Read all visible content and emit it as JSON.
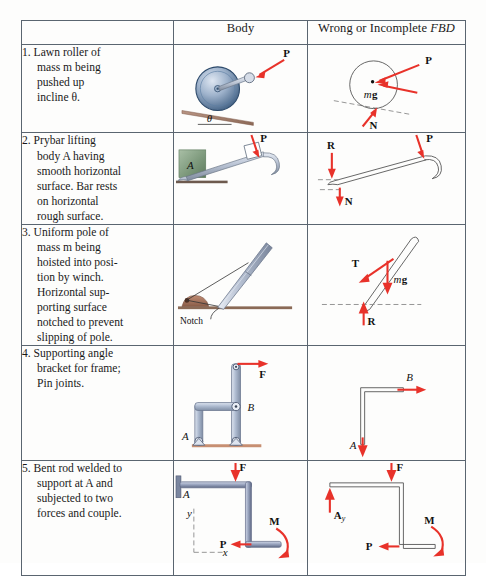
{
  "table": {
    "headers": {
      "description": "",
      "body": "Body",
      "fbd_prefix": "Wrong or Incomplete ",
      "fbd_italic": "FBD"
    },
    "rows": [
      {
        "number": "1.",
        "description": "1. Lawn roller of\nmass m being\npushed up\nincline θ.",
        "body_labels": [
          "P",
          "θ"
        ],
        "fbd_labels": [
          "P",
          "mg",
          "N"
        ]
      },
      {
        "number": "2.",
        "description": "2. Prybar lifting\nbody A having\nsmooth horizontal\nsurface.  Bar rests\non horizontal\nrough surface.",
        "body_labels": [
          "P",
          "A"
        ],
        "fbd_labels": [
          "R",
          "P",
          "N"
        ]
      },
      {
        "number": "3.",
        "description": "3. Uniform pole of\nmass m being\nhoisted into posi-\ntion by winch.\nHorizontal sup-\nporting surface\nnotched to prevent\nslipping of pole.",
        "body_labels": [
          "Notch"
        ],
        "fbd_labels": [
          "T",
          "mg",
          "R"
        ]
      },
      {
        "number": "4.",
        "description": "4. Supporting angle\nbracket for frame;\nPin joints.",
        "body_labels": [
          "F",
          "B",
          "A"
        ],
        "fbd_labels": [
          "B",
          "A"
        ]
      },
      {
        "number": "5.",
        "description": "5. Bent rod welded to\nsupport at A and\nsubjected to two\nforces and couple.",
        "body_labels": [
          "F",
          "A",
          "y",
          "x",
          "P",
          "M"
        ],
        "fbd_labels": [
          "F",
          "A_y",
          "P",
          "M"
        ]
      }
    ]
  },
  "symbols": {
    "force_P": "P",
    "force_N": "N",
    "force_R": "R",
    "force_T": "T",
    "force_F": "F",
    "moment_M": "M",
    "weight_mg_m": "m",
    "weight_mg_g": "g",
    "point_A": "A",
    "point_B": "B",
    "axis_x": "x",
    "axis_y": "y",
    "angle_theta": "θ",
    "notch_label": "Notch",
    "reaction_Ay_base": "A",
    "reaction_Ay_sub": "y"
  },
  "colors": {
    "force_red": "#e8322a",
    "rule_gray": "#5a6570",
    "rod_fill": "#c9d0e4",
    "rod_stroke": "#6b7390",
    "incline_brown": "#9a7866",
    "block_green": "#7f9a7f",
    "roller_blue": "#4a6c93"
  }
}
